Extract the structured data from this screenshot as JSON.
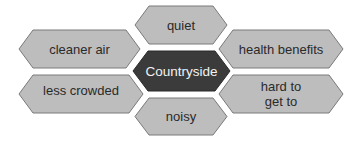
{
  "diagram": {
    "center": {
      "label": "Countryside",
      "fill": "#3b3b3b",
      "text_color": "#f2f2f2"
    },
    "nodes": [
      {
        "id": "quiet",
        "label": "quiet"
      },
      {
        "id": "cleaner-air",
        "label": "cleaner air"
      },
      {
        "id": "health-benefits",
        "label": "health benefits"
      },
      {
        "id": "less-crowded",
        "label": "less crowded"
      },
      {
        "id": "hard-to-get-to",
        "label_line1": "hard to",
        "label_line2": "get to"
      },
      {
        "id": "noisy",
        "label": "noisy"
      }
    ],
    "colors": {
      "node_fill": "#bdbdbd",
      "node_stroke": "#7a7a7a",
      "background": "#ffffff"
    }
  }
}
